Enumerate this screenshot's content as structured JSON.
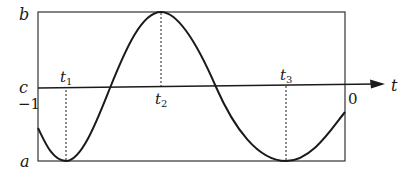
{
  "diagram": {
    "type": "periodic-function-plot",
    "colors": {
      "ink": "#1a1a1a",
      "frame": "#333333",
      "background": "#ffffff"
    },
    "frame": {
      "x": 38,
      "y": 12,
      "width": 307,
      "height": 149
    },
    "axis": {
      "label": "t",
      "y": 87,
      "x_start": 38,
      "x_end": 383
    },
    "level_labels": {
      "top": "b",
      "axis": "c",
      "bottom": "a"
    },
    "end_labels": {
      "left": "−1",
      "right": "0"
    },
    "marks": [
      {
        "base": "t",
        "sub": "1",
        "x": 66,
        "kind": "minimum",
        "y": 161
      },
      {
        "base": "t",
        "sub": "2",
        "x": 161,
        "kind": "maximum",
        "y": 12
      },
      {
        "base": "t",
        "sub": "3",
        "x": 286,
        "kind": "minimum",
        "y": 161
      }
    ],
    "curve": {
      "description": "sinusoid oscillating between a and b",
      "start": {
        "x": 38,
        "y": 128
      },
      "zero_crossings_x": [
        110,
        216
      ],
      "end": {
        "x": 345,
        "y": 112
      }
    }
  }
}
